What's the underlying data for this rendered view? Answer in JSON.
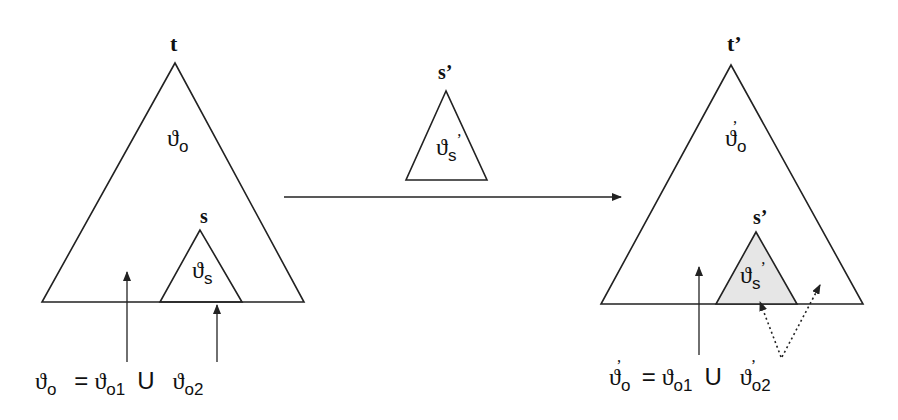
{
  "diagram": {
    "left_tree": {
      "root_label": "t",
      "region_label": {
        "symbol": "ϑ",
        "sub": "o"
      },
      "subtree_label": "s",
      "subtree_region": {
        "symbol": "ϑ",
        "sub": "s"
      },
      "equation": {
        "lhs": {
          "symbol": "ϑ",
          "sub": "o"
        },
        "eq": "=",
        "term1": {
          "symbol": "ϑ",
          "sub": "o1"
        },
        "union": "U",
        "term2": {
          "symbol": "ϑ",
          "sub": "o2"
        }
      }
    },
    "middle_tree": {
      "root_label": "s’",
      "region_label": {
        "symbol": "ϑ",
        "sub": "s",
        "prime": "’"
      }
    },
    "right_tree": {
      "root_label": "t’",
      "region_label": {
        "symbol": "ϑ",
        "sub": "o",
        "prime": "’"
      },
      "subtree_label": "s’",
      "subtree_region": {
        "symbol": "ϑ",
        "sub": "s",
        "prime": "’"
      },
      "equation": {
        "lhs": {
          "symbol": "ϑ",
          "sub": "o",
          "prime": "’"
        },
        "eq": "=",
        "term1": {
          "symbol": "ϑ",
          "sub": "o1"
        },
        "union": "U",
        "term2": {
          "symbol": "ϑ",
          "sub": "o2",
          "prime": "’"
        }
      }
    },
    "colors": {
      "line": "#222222",
      "shade": "#e6e6e6",
      "background": "#ffffff"
    }
  }
}
